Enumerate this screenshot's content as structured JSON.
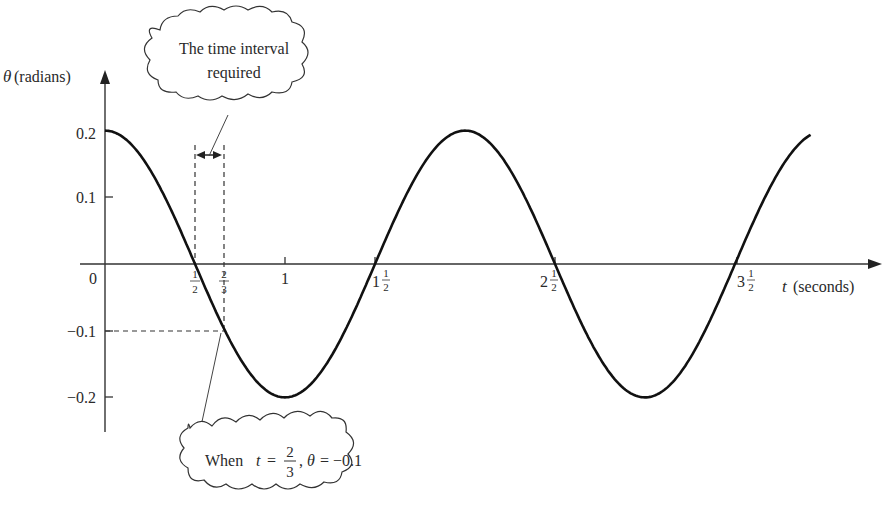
{
  "chart_data": {
    "type": "line",
    "title": "",
    "xlabel": "t (seconds)",
    "ylabel": "θ (radians)",
    "function": "θ = 0.2 cos(πt)",
    "x_range": [
      0,
      3.92
    ],
    "ylim": [
      -0.2,
      0.2
    ],
    "grid": false,
    "legend": "none",
    "x_ticks": [
      {
        "value": 0,
        "label": "0"
      },
      {
        "value": 0.5,
        "label": "1/2"
      },
      {
        "value": 0.6667,
        "label": "2/3"
      },
      {
        "value": 1,
        "label": "1"
      },
      {
        "value": 1.5,
        "label": "1 1/2"
      },
      {
        "value": 2.5,
        "label": "2 1/2"
      },
      {
        "value": 3.5,
        "label": "3 1/2"
      }
    ],
    "y_ticks": [
      {
        "value": 0.2,
        "label": "0.2"
      },
      {
        "value": 0.1,
        "label": "0.1"
      },
      {
        "value": -0.1,
        "label": "−0.1"
      },
      {
        "value": -0.2,
        "label": "−0.2"
      }
    ],
    "series": [
      {
        "name": "θ(t)",
        "x": [
          0,
          0.5,
          1,
          1.5,
          2,
          2.5,
          3,
          3.5,
          3.92
        ],
        "values": [
          0.2,
          0,
          -0.2,
          0,
          0.2,
          0,
          -0.2,
          0,
          0.194
        ]
      }
    ],
    "annotations": [
      {
        "text": "The time interval required",
        "type": "cloud-callout",
        "points_to": "interval between t=1/2 and t=2/3"
      },
      {
        "text": "When t = 2/3, θ = −0.1",
        "type": "cloud-callout",
        "points_to": [
          0.6667,
          -0.1
        ]
      }
    ]
  },
  "labels": {
    "y_axis_symbol": "θ",
    "y_axis_unit": "(radians)",
    "x_axis_symbol": "t",
    "x_axis_unit": "(seconds)",
    "origin": "0",
    "y_0_2": "0.2",
    "y_0_1": "0.1",
    "y_m0_1": "−0.1",
    "y_m0_2": "−0.2",
    "x_1": "1",
    "x_1_5_whole": "1",
    "x_2_5_whole": "2",
    "x_3_5_whole": "3",
    "frac_num_1": "1",
    "frac_num_2": "2",
    "frac_den_2": "2",
    "frac_den_3": "3",
    "cloud_top_line1": "The time interval",
    "cloud_top_line2": "required",
    "cloud_bottom_when": "When",
    "cloud_bottom_t": "t",
    "cloud_bottom_eq": "=",
    "cloud_bottom_theta": "θ",
    "cloud_bottom_value": "= −0.1",
    "cloud_bottom_comma": ","
  }
}
